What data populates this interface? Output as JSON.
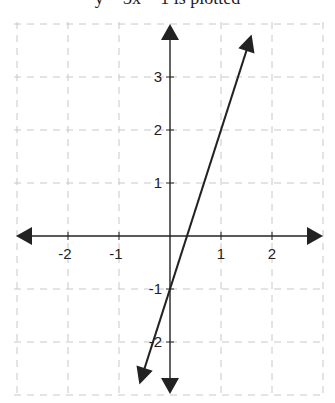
{
  "caption": "y = 3x − 1 is plotted",
  "colors": {
    "axis": "#222222",
    "grid": "#c8c8c8",
    "line": "#222222",
    "background": "#ffffff"
  },
  "chart_data": {
    "type": "line",
    "title": "",
    "xlabel": "",
    "ylabel": "",
    "equation": "y = 3x - 1",
    "slope": 3,
    "y_intercept": -1,
    "x_intercept": 0.333,
    "x": [
      -0.6,
      0,
      0.333,
      1,
      1.6
    ],
    "y": [
      -2.8,
      -1,
      0,
      2,
      3.8
    ],
    "xlim": [
      -3,
      3
    ],
    "ylim": [
      -3,
      4
    ],
    "x_ticks": [
      -2,
      -1,
      1,
      2
    ],
    "x_tick_labels": [
      "-2",
      "-1",
      "1",
      "2"
    ],
    "y_ticks": [
      -2,
      -1,
      1,
      2,
      3
    ],
    "y_tick_labels": [
      "-2",
      "-1",
      "1",
      "2",
      "3"
    ],
    "grid": true,
    "grid_style": "dashed",
    "axes_arrows": true,
    "line_arrows": true,
    "legend": null
  },
  "layout": {
    "origin_px": [
      170,
      236
    ],
    "x_unit_px": 51,
    "y_unit_px": 53
  }
}
